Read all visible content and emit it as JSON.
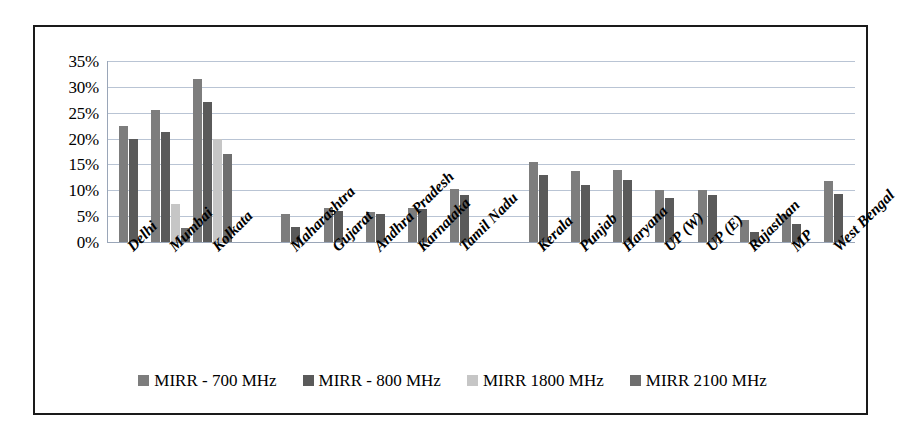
{
  "chart_data": {
    "type": "bar",
    "title": "",
    "subtitle": "",
    "xlabel": "",
    "ylabel": "",
    "ylim": [
      0,
      35
    ],
    "ytick_labels": [
      "35%",
      "30%",
      "25%",
      "20%",
      "15%",
      "10%",
      "5%",
      "0%"
    ],
    "ytick_values": [
      35,
      30,
      25,
      20,
      15,
      10,
      5,
      0
    ],
    "grid": true,
    "legend_position": "bottom",
    "categories": [
      "Delhi",
      "Mumbai",
      "Kolkata",
      "Maharashtra",
      "Gujarat",
      "Andhra Pradesh",
      "Karnataka",
      "Tamil Nadu",
      "Kerala",
      "Punjab",
      "Haryana",
      "UP (W)",
      "UP (E)",
      "Rajasthan",
      "MP",
      "West Bengal"
    ],
    "series": [
      {
        "name": "MIRR - 700 MHz",
        "color": "#7d7d7d",
        "values": [
          22.5,
          25.5,
          31.5,
          5.5,
          6.5,
          5.8,
          6.5,
          10.3,
          15.5,
          13.8,
          14.0,
          10.0,
          10.0,
          4.3,
          5.5,
          11.8
        ]
      },
      {
        "name": "MIRR - 800 MHz",
        "color": "#5a5a5a",
        "values": [
          20.0,
          21.3,
          27.0,
          3.0,
          6.0,
          5.5,
          6.3,
          9.0,
          13.0,
          11.0,
          12.0,
          8.5,
          9.0,
          2.0,
          3.5,
          9.3
        ]
      },
      {
        "name": "MIRR 1800 MHz",
        "color": "#c6c6c6",
        "values": [
          null,
          7.3,
          20.0,
          null,
          null,
          null,
          null,
          null,
          null,
          null,
          null,
          null,
          null,
          null,
          null,
          null
        ]
      },
      {
        "name": "MIRR 2100 MHz",
        "color": "#6e6e6e",
        "values": [
          null,
          2.8,
          17.0,
          null,
          null,
          null,
          null,
          null,
          null,
          null,
          null,
          null,
          null,
          null,
          null,
          null
        ]
      }
    ]
  },
  "legend": {
    "items": [
      {
        "label": "MIRR - 700 MHz"
      },
      {
        "label": "MIRR - 800 MHz"
      },
      {
        "label": "MIRR 1800 MHz"
      },
      {
        "label": "MIRR 2100 MHz"
      }
    ]
  },
  "colors": {
    "series_700": "#7d7d7d",
    "series_800": "#5a5a5a",
    "series_1800": "#c6c6c6",
    "series_2100": "#6e6e6e",
    "gridline": "#b9c4d4",
    "border": "#1a1a1a",
    "background": "#ffffff"
  }
}
